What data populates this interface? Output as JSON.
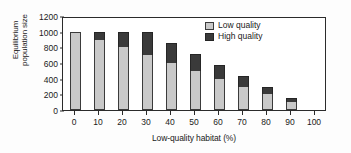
{
  "chart_data": {
    "type": "bar",
    "stacked": true,
    "title": "",
    "xlabel": "Low-quality habitat (%)",
    "ylabel": "Equilibrium population size",
    "ylabel_line1": "Equilibrium",
    "ylabel_line2": "population size",
    "categories": [
      "0",
      "10",
      "20",
      "30",
      "40",
      "50",
      "60",
      "70",
      "80",
      "90",
      "100"
    ],
    "xticklabels": [
      "0",
      "10",
      "20",
      "30",
      "40",
      "50",
      "60",
      "70",
      "80",
      "90",
      "100"
    ],
    "yticklabels": [
      "0",
      "200",
      "400",
      "600",
      "800",
      "1000",
      "1200"
    ],
    "ytickvalues": [
      0,
      200,
      400,
      600,
      800,
      1000,
      1200
    ],
    "ylim": [
      0,
      1200
    ],
    "xlim": [
      -5,
      105
    ],
    "grid": false,
    "legend_position": "upper-right",
    "series": [
      {
        "name": "Low quality",
        "color": "#c9c9c9",
        "values": [
          1000,
          900,
          800,
          700,
          600,
          500,
          400,
          300,
          200,
          100,
          0
        ]
      },
      {
        "name": "High quality",
        "color": "#3a3a3a",
        "values": [
          0,
          100,
          200,
          300,
          260,
          215,
          175,
          135,
          90,
          55,
          0
        ]
      }
    ],
    "totals": [
      1000,
      1000,
      1000,
      1000,
      860,
      715,
      575,
      435,
      290,
      155,
      0
    ]
  },
  "legend": {
    "items": [
      {
        "label": "Low quality",
        "color": "#c9c9c9"
      },
      {
        "label": "High quality",
        "color": "#3a3a3a"
      }
    ]
  }
}
